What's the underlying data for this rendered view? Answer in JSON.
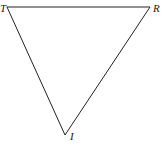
{
  "diagram": {
    "type": "triangle",
    "vertices": [
      {
        "label": "T",
        "x": 7,
        "y": 7
      },
      {
        "label": "R",
        "x": 150,
        "y": 7
      },
      {
        "label": "I",
        "x": 65,
        "y": 135
      }
    ],
    "edges": [
      [
        "T",
        "R"
      ],
      [
        "R",
        "I"
      ],
      [
        "I",
        "T"
      ]
    ],
    "stroke_color": "#222222"
  }
}
